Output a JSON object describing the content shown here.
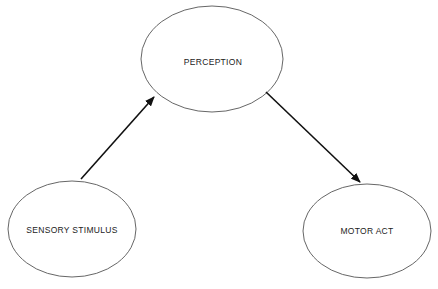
{
  "diagram": {
    "type": "flow",
    "nodes": [
      {
        "id": "perception",
        "label": "PERCEPTION"
      },
      {
        "id": "sensory",
        "label": "SENSORY STIMULUS"
      },
      {
        "id": "motor",
        "label": "MOTOR ACT"
      }
    ],
    "edges": [
      {
        "from": "sensory",
        "to": "perception"
      },
      {
        "from": "perception",
        "to": "motor"
      }
    ],
    "colors": {
      "stroke": "#333333",
      "arrow": "#111111",
      "background": "#ffffff"
    }
  }
}
